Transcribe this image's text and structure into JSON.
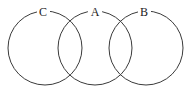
{
  "diagram": {
    "type": "venn",
    "sets": [
      {
        "label": "C",
        "cx": 45,
        "cy": 48,
        "r": 37,
        "label_x": 43,
        "label_y": 16
      },
      {
        "label": "A",
        "cx": 95,
        "cy": 48,
        "r": 37,
        "label_x": 95,
        "label_y": 16
      },
      {
        "label": "B",
        "cx": 146,
        "cy": 48,
        "r": 37,
        "label_x": 144,
        "label_y": 16
      }
    ],
    "stroke_color": "#3a3a3a",
    "background": "#ffffff"
  }
}
